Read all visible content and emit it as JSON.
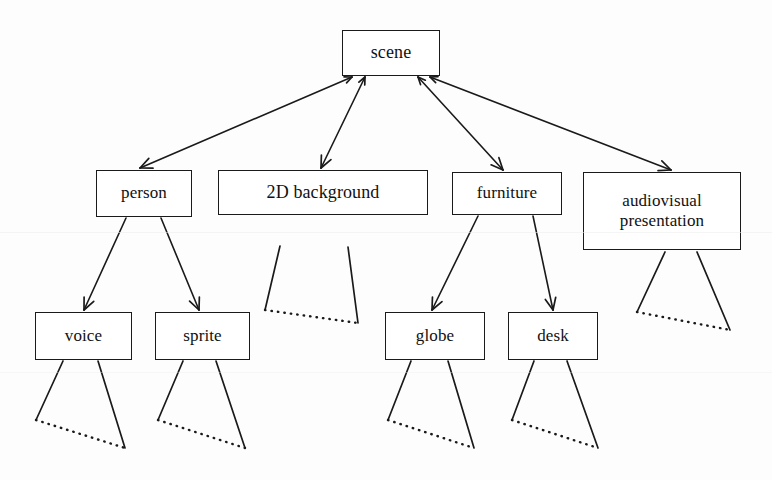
{
  "diagram": {
    "type": "tree-diagram",
    "line_color": "#1a1a1a",
    "box_fill": "#ffffff",
    "background": "#fdfdfd",
    "nodes": [
      {
        "id": "scene",
        "label": "scene",
        "level": 0,
        "x": 342,
        "y": 30,
        "w": 98,
        "h": 46,
        "font_size": 18
      },
      {
        "id": "person",
        "label": "person",
        "level": 1,
        "x": 96,
        "y": 170,
        "w": 96,
        "h": 47,
        "font_size": 17
      },
      {
        "id": "background2d",
        "label": "2D background",
        "level": 1,
        "x": 218,
        "y": 170,
        "w": 210,
        "h": 45,
        "font_size": 18
      },
      {
        "id": "furniture",
        "label": "furniture",
        "level": 1,
        "x": 452,
        "y": 172,
        "w": 110,
        "h": 43,
        "font_size": 17
      },
      {
        "id": "audiovisual",
        "label": "audiovisual\npresentation",
        "level": 1,
        "x": 583,
        "y": 172,
        "w": 158,
        "h": 78,
        "font_size": 17
      },
      {
        "id": "voice",
        "label": "voice",
        "level": 2,
        "x": 35,
        "y": 312,
        "w": 97,
        "h": 48,
        "font_size": 17
      },
      {
        "id": "sprite",
        "label": "sprite",
        "level": 2,
        "x": 155,
        "y": 312,
        "w": 95,
        "h": 48,
        "font_size": 17
      },
      {
        "id": "globe",
        "label": "globe",
        "level": 2,
        "x": 385,
        "y": 312,
        "w": 100,
        "h": 48,
        "font_size": 17
      },
      {
        "id": "desk",
        "label": "desk",
        "level": 2,
        "x": 508,
        "y": 312,
        "w": 90,
        "h": 48,
        "font_size": 17
      }
    ],
    "edges": [
      {
        "id": "scene-person",
        "from": "scene",
        "to": "person",
        "x1": 352,
        "y1": 77,
        "x2": 140,
        "y2": 168,
        "arrow_head": "both"
      },
      {
        "id": "scene-background2d",
        "from": "scene",
        "to": "background2d",
        "x1": 365,
        "y1": 77,
        "x2": 321,
        "y2": 168,
        "arrow_head": "both"
      },
      {
        "id": "scene-furniture",
        "from": "scene",
        "to": "furniture",
        "x1": 418,
        "y1": 77,
        "x2": 503,
        "y2": 170,
        "arrow_head": "both"
      },
      {
        "id": "scene-audiovisual",
        "from": "scene",
        "to": "audiovisual",
        "x1": 430,
        "y1": 77,
        "x2": 671,
        "y2": 170,
        "arrow_head": "both"
      },
      {
        "id": "person-voice",
        "from": "person",
        "to": "voice",
        "x1": 126,
        "y1": 218,
        "x2": 84,
        "y2": 310,
        "arrow_head": "end"
      },
      {
        "id": "person-sprite",
        "from": "person",
        "to": "sprite",
        "x1": 161,
        "y1": 218,
        "x2": 199,
        "y2": 310,
        "arrow_head": "end"
      },
      {
        "id": "furniture-globe",
        "from": "furniture",
        "to": "globe",
        "x1": 478,
        "y1": 216,
        "x2": 432,
        "y2": 310,
        "arrow_head": "end"
      },
      {
        "id": "furniture-desk",
        "from": "furniture",
        "to": "desk",
        "x1": 533,
        "y1": 216,
        "x2": 553,
        "y2": 310,
        "arrow_head": "end"
      }
    ],
    "continuation_fans": [
      {
        "id": "fan-background2d",
        "parent": "background2d",
        "ax": 280,
        "ay": 246,
        "bx": 348,
        "by": 247,
        "cx": 265,
        "cy": 310,
        "dx": 358,
        "dy": 323
      },
      {
        "id": "fan-audiovisual",
        "parent": "audiovisual",
        "ax": 665,
        "ay": 252,
        "bx": 697,
        "by": 252,
        "cx": 637,
        "cy": 312,
        "dx": 730,
        "dy": 330
      },
      {
        "id": "fan-voice",
        "parent": "voice",
        "ax": 63,
        "ay": 361,
        "bx": 98,
        "by": 361,
        "cx": 36,
        "cy": 420,
        "dx": 125,
        "dy": 448
      },
      {
        "id": "fan-sprite",
        "parent": "sprite",
        "ax": 183,
        "ay": 361,
        "bx": 216,
        "by": 361,
        "cx": 158,
        "cy": 420,
        "dx": 245,
        "dy": 448
      },
      {
        "id": "fan-globe",
        "parent": "globe",
        "ax": 411,
        "ay": 361,
        "bx": 448,
        "by": 361,
        "cx": 388,
        "cy": 420,
        "dx": 474,
        "dy": 448
      },
      {
        "id": "fan-desk",
        "parent": "desk",
        "ax": 534,
        "ay": 361,
        "bx": 567,
        "by": 361,
        "cx": 512,
        "cy": 420,
        "dx": 598,
        "dy": 448
      }
    ],
    "artifact_scanlines": [
      {
        "y": 232,
        "opacity": 0.55
      },
      {
        "y": 372,
        "opacity": 0.35
      }
    ]
  }
}
